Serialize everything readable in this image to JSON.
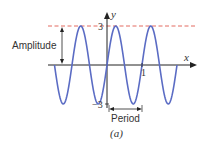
{
  "chart_data": {
    "type": "line",
    "title": "",
    "caption": "(a)",
    "xlabel": "x",
    "ylabel": "y",
    "function_description": "sinusoid with amplitude 3 and period 1",
    "amplitude": 3,
    "period": 1,
    "x": [
      -1.5,
      -1.25,
      -1.0,
      -0.75,
      -0.5,
      -0.25,
      0,
      0.25,
      0.5,
      0.75,
      1.0,
      1.25,
      1.5,
      1.75,
      2.0
    ],
    "values": [
      0,
      -3,
      0,
      3,
      0,
      -3,
      0,
      3,
      0,
      -3,
      0,
      3,
      0,
      -3,
      0
    ],
    "ylim": [
      -3,
      3
    ],
    "y_tick_labels": [
      "3",
      "-3"
    ],
    "x_tick_labels": [
      "1"
    ],
    "annotations": [
      {
        "text": "Amplitude",
        "type": "double-arrow",
        "from_y": 0,
        "to_y": 3
      },
      {
        "text": "Period",
        "type": "double-arrow",
        "from_x": 0,
        "to_x": 1
      }
    ],
    "reference_line": {
      "y": 3,
      "style": "dashed",
      "color": "#e05a4f"
    },
    "colors": {
      "curve": "#5b6cc4",
      "axes": "#222222",
      "dashed": "#e05a4f"
    }
  },
  "labels": {
    "x_axis": "x",
    "y_axis": "y",
    "y_top": "3",
    "y_bottom": "−3",
    "x_tick": "1",
    "amplitude": "Amplitude",
    "period": "Period",
    "caption": "(a)"
  }
}
